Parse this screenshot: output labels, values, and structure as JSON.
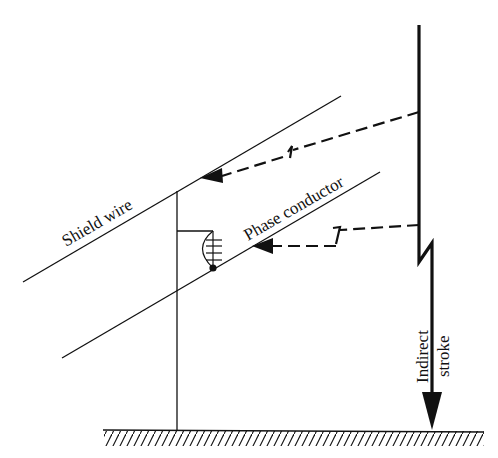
{
  "diagram": {
    "type": "lightning-indirect-stroke-transmission-line",
    "labels": {
      "shield_wire": "Shield wire",
      "phase_conductor": "Phase conductor",
      "stroke_line1": "Indirect",
      "stroke_line2": "stroke"
    },
    "colors": {
      "line": "#111111",
      "background": "#ffffff"
    }
  }
}
